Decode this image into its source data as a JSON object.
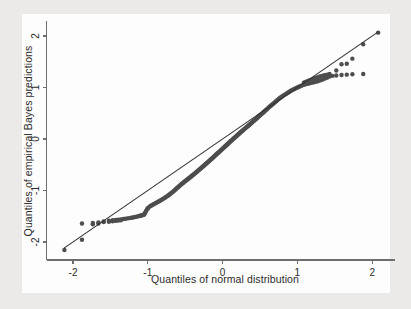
{
  "figure": {
    "background_color": "#eceae9",
    "panel_color": "#fdfdfd",
    "marker_color": "#4d4d4d",
    "line_color": "#2f2f2f",
    "axis_color": "#6e6e6e"
  },
  "chart_data": {
    "type": "scatter",
    "title": "",
    "subtitle": "",
    "xlabel": "Quantiles of normal distribution",
    "ylabel": "Quantiles of empirical Bayes predictions",
    "xlim": [
      -2.35,
      2.3
    ],
    "ylim": [
      -2.35,
      2.3
    ],
    "xticks": [
      -2,
      -1,
      0,
      1,
      2
    ],
    "yticks": [
      -2,
      -1,
      0,
      1,
      2
    ],
    "xticklabels": [
      "-2",
      "-1",
      "0",
      "1",
      "2"
    ],
    "yticklabels": [
      "-2",
      "-1",
      "0",
      "1",
      "2"
    ],
    "grid": false,
    "legend": null,
    "annotations": [],
    "series": [
      {
        "name": "reference-line",
        "type": "line",
        "description": "45 degree identity reference line",
        "x": [
          -2.12,
          2.08
        ],
        "y": [
          -2.12,
          2.08
        ]
      },
      {
        "name": "empirical-bayes-quantiles",
        "type": "scatter",
        "marker": "filled-circle",
        "marker_size": 4.4,
        "n_points": 245,
        "points": [
          [
            -2.115,
            -2.155
          ],
          [
            -1.88,
            -1.955
          ],
          [
            -1.735,
            -1.655
          ],
          [
            -1.66,
            -1.64
          ],
          [
            -1.59,
            -1.6
          ],
          [
            -1.52,
            -1.585
          ],
          [
            -1.47,
            -1.575
          ],
          [
            -1.43,
            -1.57
          ],
          [
            -1.395,
            -1.565
          ],
          [
            -1.36,
            -1.56
          ],
          [
            -1.33,
            -1.552
          ],
          [
            -1.3,
            -1.548
          ],
          [
            -1.272,
            -1.542
          ],
          [
            -1.246,
            -1.536
          ],
          [
            -1.22,
            -1.53
          ],
          [
            -1.196,
            -1.524
          ],
          [
            -1.172,
            -1.516
          ],
          [
            -1.15,
            -1.508
          ],
          [
            -1.128,
            -1.5
          ],
          [
            -1.107,
            -1.492
          ],
          [
            -1.086,
            -1.484
          ],
          [
            -1.066,
            -1.476
          ],
          [
            -1.047,
            -1.468
          ],
          [
            -1.028,
            -1.415
          ],
          [
            -1.01,
            -1.362
          ],
          [
            -0.992,
            -1.332
          ],
          [
            -0.974,
            -1.312
          ],
          [
            -0.957,
            -1.296
          ],
          [
            -0.94,
            -1.282
          ],
          [
            -0.924,
            -1.268
          ],
          [
            -0.908,
            -1.255
          ],
          [
            -0.892,
            -1.243
          ],
          [
            -0.877,
            -1.231
          ],
          [
            -0.862,
            -1.219
          ],
          [
            -0.847,
            -1.207
          ],
          [
            -0.832,
            -1.194
          ],
          [
            -0.818,
            -1.182
          ],
          [
            -0.804,
            -1.17
          ],
          [
            -0.79,
            -1.157
          ],
          [
            -0.776,
            -1.144
          ],
          [
            -0.763,
            -1.131
          ],
          [
            -0.749,
            -1.118
          ],
          [
            -0.736,
            -1.105
          ],
          [
            -0.723,
            -1.092
          ],
          [
            -0.71,
            -1.078
          ],
          [
            -0.698,
            -1.064
          ],
          [
            -0.685,
            -1.05
          ],
          [
            -0.673,
            -1.036
          ],
          [
            -0.66,
            -1.02
          ],
          [
            -0.648,
            -1.004
          ],
          [
            -0.636,
            -0.988
          ],
          [
            -0.624,
            -0.972
          ],
          [
            -0.612,
            -0.956
          ],
          [
            -0.601,
            -0.941
          ],
          [
            -0.589,
            -0.926
          ],
          [
            -0.578,
            -0.912
          ],
          [
            -0.566,
            -0.898
          ],
          [
            -0.555,
            -0.884
          ],
          [
            -0.544,
            -0.87
          ],
          [
            -0.533,
            -0.857
          ],
          [
            -0.522,
            -0.844
          ],
          [
            -0.511,
            -0.831
          ],
          [
            -0.5,
            -0.818
          ],
          [
            -0.489,
            -0.806
          ],
          [
            -0.479,
            -0.794
          ],
          [
            -0.468,
            -0.782
          ],
          [
            -0.458,
            -0.77
          ],
          [
            -0.447,
            -0.758
          ],
          [
            -0.437,
            -0.746
          ],
          [
            -0.427,
            -0.734
          ],
          [
            -0.416,
            -0.722
          ],
          [
            -0.406,
            -0.71
          ],
          [
            -0.396,
            -0.698
          ],
          [
            -0.386,
            -0.686
          ],
          [
            -0.376,
            -0.674
          ],
          [
            -0.366,
            -0.662
          ],
          [
            -0.356,
            -0.65
          ],
          [
            -0.346,
            -0.638
          ],
          [
            -0.337,
            -0.626
          ],
          [
            -0.327,
            -0.614
          ],
          [
            -0.317,
            -0.602
          ],
          [
            -0.308,
            -0.59
          ],
          [
            -0.298,
            -0.578
          ],
          [
            -0.288,
            -0.566
          ],
          [
            -0.279,
            -0.554
          ],
          [
            -0.269,
            -0.542
          ],
          [
            -0.26,
            -0.53
          ],
          [
            -0.25,
            -0.518
          ],
          [
            -0.241,
            -0.506
          ],
          [
            -0.232,
            -0.494
          ],
          [
            -0.222,
            -0.482
          ],
          [
            -0.213,
            -0.47
          ],
          [
            -0.204,
            -0.458
          ],
          [
            -0.194,
            -0.446
          ],
          [
            -0.185,
            -0.434
          ],
          [
            -0.176,
            -0.422
          ],
          [
            -0.167,
            -0.41
          ],
          [
            -0.157,
            -0.398
          ],
          [
            -0.148,
            -0.386
          ],
          [
            -0.139,
            -0.374
          ],
          [
            -0.13,
            -0.362
          ],
          [
            -0.121,
            -0.35
          ],
          [
            -0.112,
            -0.338
          ],
          [
            -0.103,
            -0.326
          ],
          [
            -0.094,
            -0.314
          ],
          [
            -0.085,
            -0.302
          ],
          [
            -0.076,
            -0.29
          ],
          [
            -0.067,
            -0.278
          ],
          [
            -0.058,
            -0.266
          ],
          [
            -0.049,
            -0.254
          ],
          [
            -0.04,
            -0.242
          ],
          [
            -0.031,
            -0.23
          ],
          [
            -0.022,
            -0.218
          ],
          [
            -0.013,
            -0.206
          ],
          [
            -0.004,
            -0.194
          ],
          [
            0.005,
            -0.182
          ],
          [
            0.014,
            -0.17
          ],
          [
            0.023,
            -0.158
          ],
          [
            0.032,
            -0.146
          ],
          [
            0.041,
            -0.134
          ],
          [
            0.05,
            -0.122
          ],
          [
            0.058,
            -0.11
          ],
          [
            0.067,
            -0.098
          ],
          [
            0.076,
            -0.086
          ],
          [
            0.085,
            -0.074
          ],
          [
            0.094,
            -0.062
          ],
          [
            0.103,
            -0.05
          ],
          [
            0.112,
            -0.038
          ],
          [
            0.121,
            -0.026
          ],
          [
            0.13,
            -0.014
          ],
          [
            0.139,
            -0.002
          ],
          [
            0.148,
            0.01
          ],
          [
            0.157,
            0.022
          ],
          [
            0.167,
            0.034
          ],
          [
            0.176,
            0.046
          ],
          [
            0.185,
            0.058
          ],
          [
            0.194,
            0.07
          ],
          [
            0.204,
            0.082
          ],
          [
            0.213,
            0.094
          ],
          [
            0.222,
            0.106
          ],
          [
            0.232,
            0.118
          ],
          [
            0.241,
            0.13
          ],
          [
            0.25,
            0.142
          ],
          [
            0.26,
            0.154
          ],
          [
            0.269,
            0.166
          ],
          [
            0.279,
            0.178
          ],
          [
            0.288,
            0.19
          ],
          [
            0.298,
            0.202
          ],
          [
            0.308,
            0.214
          ],
          [
            0.317,
            0.226
          ],
          [
            0.327,
            0.238
          ],
          [
            0.337,
            0.25
          ],
          [
            0.346,
            0.262
          ],
          [
            0.356,
            0.274
          ],
          [
            0.366,
            0.286
          ],
          [
            0.376,
            0.299
          ],
          [
            0.386,
            0.312
          ],
          [
            0.396,
            0.325
          ],
          [
            0.406,
            0.338
          ],
          [
            0.416,
            0.351
          ],
          [
            0.427,
            0.364
          ],
          [
            0.437,
            0.377
          ],
          [
            0.447,
            0.39
          ],
          [
            0.458,
            0.404
          ],
          [
            0.468,
            0.418
          ],
          [
            0.479,
            0.432
          ],
          [
            0.489,
            0.446
          ],
          [
            0.5,
            0.46
          ],
          [
            0.511,
            0.474
          ],
          [
            0.522,
            0.488
          ],
          [
            0.533,
            0.502
          ],
          [
            0.544,
            0.516
          ],
          [
            0.555,
            0.53
          ],
          [
            0.566,
            0.545
          ],
          [
            0.578,
            0.56
          ],
          [
            0.589,
            0.575
          ],
          [
            0.601,
            0.59
          ],
          [
            0.612,
            0.605
          ],
          [
            0.624,
            0.62
          ],
          [
            0.636,
            0.635
          ],
          [
            0.648,
            0.65
          ],
          [
            0.66,
            0.665
          ],
          [
            0.673,
            0.68
          ],
          [
            0.685,
            0.696
          ],
          [
            0.698,
            0.712
          ],
          [
            0.71,
            0.728
          ],
          [
            0.723,
            0.744
          ],
          [
            0.736,
            0.76
          ],
          [
            0.749,
            0.776
          ],
          [
            0.763,
            0.792
          ],
          [
            0.776,
            0.806
          ],
          [
            0.79,
            0.82
          ],
          [
            0.804,
            0.834
          ],
          [
            0.818,
            0.848
          ],
          [
            0.832,
            0.862
          ],
          [
            0.847,
            0.876
          ],
          [
            0.862,
            0.89
          ],
          [
            0.877,
            0.904
          ],
          [
            0.892,
            0.918
          ],
          [
            0.908,
            0.932
          ],
          [
            0.924,
            0.946
          ],
          [
            0.94,
            0.958
          ],
          [
            0.957,
            0.97
          ],
          [
            0.974,
            0.982
          ],
          [
            0.992,
            0.994
          ],
          [
            1.01,
            1.006
          ],
          [
            1.028,
            1.018
          ],
          [
            1.047,
            1.03
          ],
          [
            1.066,
            1.042
          ],
          [
            1.086,
            1.054
          ],
          [
            1.107,
            1.062
          ],
          [
            1.128,
            1.07
          ],
          [
            1.15,
            1.078
          ],
          [
            1.172,
            1.086
          ],
          [
            1.196,
            1.094
          ],
          [
            1.22,
            1.102
          ],
          [
            1.246,
            1.112
          ],
          [
            1.272,
            1.122
          ],
          [
            1.3,
            1.136
          ],
          [
            1.33,
            1.15
          ],
          [
            1.36,
            1.168
          ],
          [
            1.395,
            1.19
          ],
          [
            1.43,
            1.212
          ],
          [
            1.47,
            1.226
          ],
          [
            1.52,
            1.234
          ],
          [
            1.59,
            1.242
          ],
          [
            1.66,
            1.25
          ],
          [
            1.735,
            1.256
          ],
          [
            1.88,
            1.262
          ],
          [
            2.08,
            2.065
          ],
          [
            1.52,
            1.33
          ],
          [
            1.59,
            1.452
          ],
          [
            1.66,
            1.462
          ],
          [
            1.735,
            1.56
          ],
          [
            1.88,
            1.84
          ],
          [
            1.43,
            1.264
          ],
          [
            1.395,
            1.25
          ],
          [
            1.36,
            1.238
          ],
          [
            1.33,
            1.226
          ],
          [
            1.3,
            1.214
          ],
          [
            1.272,
            1.2
          ],
          [
            1.246,
            1.186
          ],
          [
            1.22,
            1.172
          ],
          [
            1.196,
            1.158
          ],
          [
            1.172,
            1.144
          ],
          [
            1.15,
            1.13
          ],
          [
            1.128,
            1.118
          ],
          [
            1.107,
            1.106
          ],
          [
            1.086,
            1.094
          ],
          [
            -1.88,
            -1.64
          ],
          [
            -1.735,
            -1.63
          ],
          [
            -1.66,
            -1.622
          ],
          [
            -1.59,
            -1.614
          ],
          [
            -1.52,
            -1.606
          ],
          [
            -1.47,
            -1.598
          ],
          [
            -1.43,
            -1.59
          ],
          [
            -1.395,
            -1.584
          ],
          [
            -1.36,
            -1.578
          ],
          [
            -1.1,
            -1.488
          ],
          [
            -1.08,
            -1.48
          ],
          [
            -1.06,
            -1.472
          ],
          [
            -1.04,
            -1.44
          ],
          [
            -1.02,
            -1.39
          ],
          [
            -1.0,
            -1.348
          ]
        ]
      }
    ]
  }
}
